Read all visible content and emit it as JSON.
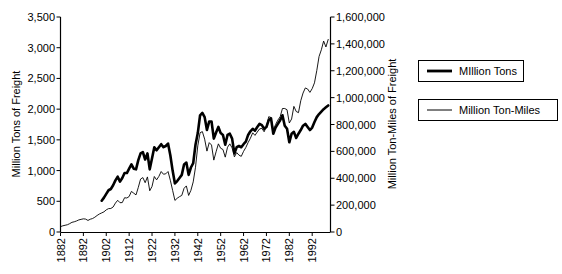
{
  "chart_data": {
    "type": "line",
    "title": "",
    "xlabel": "",
    "ylabel": "Million Tons of Freight",
    "y2label": "Million Ton-Miles of Freight",
    "grid": false,
    "legend_position": "right",
    "xlim": [
      1882,
      2000
    ],
    "ylim": [
      0,
      3500
    ],
    "y2lim": [
      0,
      1600000
    ],
    "x_tick_labels": [
      "1882",
      "1892",
      "1902",
      "1912",
      "1922",
      "1932",
      "1942",
      "1952",
      "1962",
      "1972",
      "1982",
      "1992"
    ],
    "x_ticks": [
      1882,
      1892,
      1902,
      1912,
      1922,
      1932,
      1942,
      1952,
      1962,
      1972,
      1982,
      1992
    ],
    "y_tick_labels": [
      "0",
      "500",
      "1,000",
      "1,500",
      "2,000",
      "2,500",
      "3,000",
      "3,500"
    ],
    "y_ticks": [
      0,
      500,
      1000,
      1500,
      2000,
      2500,
      3000,
      3500
    ],
    "y2_tick_labels": [
      "0",
      "200,000",
      "400,000",
      "600,000",
      "800,000",
      "1,000,000",
      "1,200,000",
      "1,400,000",
      "1,600,000"
    ],
    "y2_ticks": [
      0,
      200000,
      400000,
      600000,
      800000,
      1000000,
      1200000,
      1400000,
      1600000
    ],
    "series": [
      {
        "name": "MIllion Tons",
        "axis": "left",
        "line_width": "thick",
        "color": "#000000",
        "x": [
          1900,
          1901,
          1902,
          1903,
          1904,
          1905,
          1906,
          1907,
          1908,
          1909,
          1910,
          1911,
          1912,
          1913,
          1914,
          1915,
          1916,
          1917,
          1918,
          1919,
          1920,
          1921,
          1922,
          1923,
          1924,
          1925,
          1926,
          1927,
          1928,
          1929,
          1930,
          1931,
          1932,
          1933,
          1934,
          1935,
          1936,
          1937,
          1938,
          1939,
          1940,
          1941,
          1942,
          1943,
          1944,
          1945,
          1946,
          1947,
          1948,
          1949,
          1950,
          1951,
          1952,
          1953,
          1954,
          1955,
          1956,
          1957,
          1958,
          1959,
          1960,
          1961,
          1962,
          1963,
          1964,
          1965,
          1966,
          1967,
          1968,
          1969,
          1970,
          1971,
          1972,
          1973,
          1974,
          1975,
          1976,
          1977,
          1978,
          1979,
          1980,
          1981,
          1982,
          1983,
          1984,
          1985,
          1986,
          1987,
          1988,
          1989,
          1990,
          1991,
          1992,
          1993,
          1994,
          1995,
          1996,
          1997,
          1998,
          1999
        ],
        "values": [
          510,
          560,
          620,
          680,
          700,
          760,
          840,
          900,
          820,
          880,
          960,
          960,
          1030,
          1100,
          1030,
          1020,
          1170,
          1280,
          1300,
          1180,
          1280,
          1020,
          1200,
          1380,
          1330,
          1380,
          1430,
          1380,
          1400,
          1440,
          1250,
          1000,
          790,
          830,
          880,
          930,
          1100,
          1130,
          930,
          1050,
          1120,
          1420,
          1610,
          1900,
          1940,
          1870,
          1660,
          1800,
          1800,
          1520,
          1620,
          1710,
          1610,
          1580,
          1420,
          1580,
          1600,
          1520,
          1280,
          1380,
          1400,
          1380,
          1430,
          1470,
          1580,
          1640,
          1680,
          1650,
          1710,
          1760,
          1740,
          1680,
          1710,
          1820,
          1850,
          1600,
          1700,
          1760,
          1820,
          1900,
          1730,
          1680,
          1460,
          1600,
          1630,
          1530,
          1600,
          1660,
          1730,
          1760,
          1710,
          1660,
          1700,
          1790,
          1870,
          1920,
          1960,
          2000,
          2030,
          2060
        ]
      },
      {
        "name": "Million Ton-Miles",
        "axis": "right",
        "line_width": "thin",
        "color": "#000000",
        "x": [
          1882,
          1883,
          1884,
          1885,
          1886,
          1887,
          1888,
          1889,
          1890,
          1891,
          1892,
          1893,
          1894,
          1895,
          1896,
          1897,
          1898,
          1899,
          1900,
          1901,
          1902,
          1903,
          1904,
          1905,
          1906,
          1907,
          1908,
          1909,
          1910,
          1911,
          1912,
          1913,
          1914,
          1915,
          1916,
          1917,
          1918,
          1919,
          1920,
          1921,
          1922,
          1923,
          1924,
          1925,
          1926,
          1927,
          1928,
          1929,
          1930,
          1931,
          1932,
          1933,
          1934,
          1935,
          1936,
          1937,
          1938,
          1939,
          1940,
          1941,
          1942,
          1943,
          1944,
          1945,
          1946,
          1947,
          1948,
          1949,
          1950,
          1951,
          1952,
          1953,
          1954,
          1955,
          1956,
          1957,
          1958,
          1959,
          1960,
          1961,
          1962,
          1963,
          1964,
          1965,
          1966,
          1967,
          1968,
          1969,
          1970,
          1971,
          1972,
          1973,
          1974,
          1975,
          1976,
          1977,
          1978,
          1979,
          1980,
          1981,
          1982,
          1983,
          1984,
          1985,
          1986,
          1987,
          1988,
          1989,
          1990,
          1991,
          1992,
          1993,
          1994,
          1995,
          1996,
          1997,
          1998,
          1999
        ],
        "values": [
          40000,
          46000,
          50000,
          54000,
          62000,
          72000,
          76000,
          82000,
          90000,
          94000,
          98000,
          96000,
          86000,
          95000,
          100000,
          110000,
          123000,
          134000,
          142000,
          150000,
          165000,
          174000,
          175000,
          186000,
          215000,
          236000,
          218000,
          219000,
          255000,
          253000,
          264000,
          302000,
          289000,
          276000,
          332000,
          394000,
          405000,
          367000,
          410000,
          307000,
          339000,
          413000,
          388000,
          414000,
          450000,
          430000,
          433000,
          450000,
          385000,
          310000,
          235000,
          251000,
          263000,
          272000,
          325000,
          343000,
          272000,
          310000,
          373000,
          482000,
          641000,
          739000,
          747000,
          691000,
          602000,
          665000,
          647000,
          535000,
          597000,
          656000,
          623000,
          614000,
          557000,
          631000,
          656000,
          626000,
          559000,
          591000,
          572000,
          563000,
          600000,
          629000,
          666000,
          698000,
          738000,
          719000,
          744000,
          767000,
          771000,
          746000,
          785000,
          858000,
          852000,
          759000,
          800000,
          833000,
          858000,
          919000,
          919000,
          910000,
          811000,
          841000,
          935000,
          897000,
          888000,
          977000,
          1034000,
          1072000,
          1064000,
          1039000,
          1067000,
          1110000,
          1201000,
          1306000,
          1356000,
          1421000,
          1377000,
          1433000
        ]
      }
    ],
    "legend": [
      {
        "label": "MIllion Tons",
        "style": "thick"
      },
      {
        "label": "Million Ton-Miles",
        "style": "thin"
      }
    ]
  }
}
